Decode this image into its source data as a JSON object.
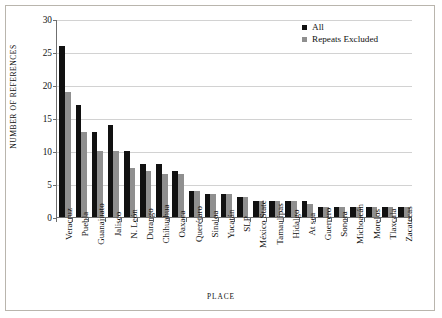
{
  "chart_data": {
    "type": "bar",
    "title": "",
    "xlabel": "PLACE",
    "ylabel": "NUMBER OF REFERENCES",
    "ylim": [
      0,
      30
    ],
    "yticks": [
      0,
      5,
      10,
      15,
      20,
      25,
      30
    ],
    "grid": true,
    "legend_position": "top-right",
    "categories": [
      "Veracruz",
      "Puebla",
      "Guanajuato",
      "Jalisco",
      "N. León",
      "Durango",
      "Chihuahua",
      "Oaxaca",
      "Querétaro",
      "Sinaloa",
      "Yucatán",
      "SLP",
      "México State",
      "Tamaulipas",
      "Hidalgo",
      "At sea",
      "Guerrero",
      "Sonora",
      "Michoacán",
      "Morelos",
      "Tlaxcala",
      "Zacatecas"
    ],
    "series": [
      {
        "name": "All",
        "color": "#111111",
        "values": [
          26,
          17,
          13,
          14,
          10,
          8,
          8,
          7,
          4,
          3.5,
          3.5,
          3,
          2.5,
          2.5,
          2.5,
          2.5,
          1.5,
          1.5,
          1.5,
          1.5,
          1.5,
          1.5
        ]
      },
      {
        "name": "Repeats Excluded",
        "color": "#8f8f8f",
        "values": [
          19,
          13,
          10,
          10,
          7.5,
          7,
          6.5,
          6.5,
          4,
          3.5,
          3.5,
          3,
          2.5,
          2.5,
          2.5,
          2,
          1.5,
          1.5,
          1.5,
          1.5,
          1.5,
          1.5
        ]
      }
    ]
  },
  "legend": {
    "items": [
      {
        "label": "All",
        "color": "#111111"
      },
      {
        "label": "Repeats Excluded",
        "color": "#8f8f8f"
      }
    ]
  }
}
